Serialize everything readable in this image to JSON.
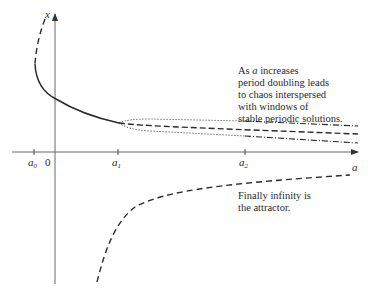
{
  "diagram": {
    "type": "bifurcation-sketch",
    "axes": {
      "vertical_label": "x",
      "horizontal_label": "a"
    },
    "ticks": [
      {
        "id": "a0",
        "base": "a",
        "sub": "0",
        "x": 34
      },
      {
        "id": "zero",
        "base": "0",
        "sub": "",
        "x": 48
      },
      {
        "id": "a1",
        "base": "a",
        "sub": "1",
        "x": 118
      },
      {
        "id": "a2",
        "base": "a",
        "sub": "2",
        "x": 245
      }
    ],
    "annotations": {
      "chaos": {
        "lines": [
          "As a increases",
          "period doubling leads",
          "to chaos interspersed",
          "with windows of",
          "stable periodic solutions."
        ],
        "line1_prefix": "As ",
        "line1_var": "a",
        "line1_suffix": " increases"
      },
      "infinity": {
        "lines": [
          "Finally infinity is",
          "the attractor."
        ]
      }
    },
    "curves": [
      {
        "name": "unstable-upper-branch",
        "style": "dashed"
      },
      {
        "name": "stable-fixed-point-branch",
        "style": "solid"
      },
      {
        "name": "period-doubling-upper",
        "style": "dotted / dash-dot"
      },
      {
        "name": "period-doubling-middle",
        "style": "dashed"
      },
      {
        "name": "period-doubling-lower",
        "style": "dotted / dash-dot"
      },
      {
        "name": "unstable-lower-branch",
        "style": "dashed"
      }
    ],
    "colors": {
      "ink": "#2a2a2a",
      "axis": "#555555",
      "background": "#ffffff"
    }
  }
}
